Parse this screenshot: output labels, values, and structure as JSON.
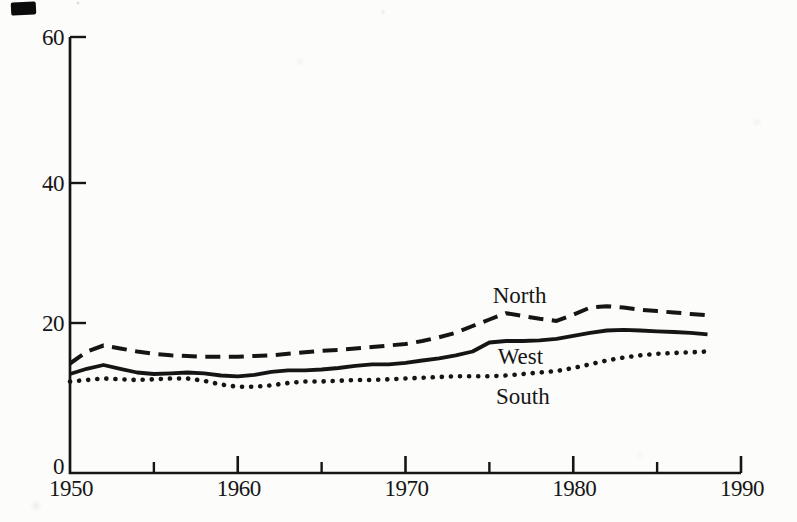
{
  "chart_data": {
    "type": "line",
    "title": "",
    "xlabel": "",
    "ylabel": "",
    "xlim": [
      1950,
      1990
    ],
    "ylim": [
      0,
      60
    ],
    "grid": false,
    "legend_position": "inline-annotations",
    "y_ticks": [
      0,
      20,
      40,
      60
    ],
    "x_tick_minor_years": [
      1955,
      1965,
      1975,
      1985
    ],
    "x_tick_major_years": [
      1960,
      1970,
      1980,
      1990
    ],
    "x_tick_labels": [
      "1950",
      "1960",
      "1970",
      "1980",
      "1990"
    ],
    "x_tick_label_years": [
      1950,
      1960,
      1970,
      1980,
      1990
    ],
    "line_color": "#151515",
    "x": [
      1950,
      1951,
      1952,
      1953,
      1954,
      1955,
      1956,
      1957,
      1958,
      1959,
      1960,
      1961,
      1962,
      1963,
      1964,
      1965,
      1966,
      1967,
      1968,
      1969,
      1970,
      1971,
      1972,
      1973,
      1974,
      1975,
      1976,
      1977,
      1978,
      1979,
      1980,
      1981,
      1982,
      1983,
      1984,
      1985,
      1986,
      1987,
      1988
    ],
    "series": [
      {
        "name": "North",
        "line_style": "dashed",
        "values": [
          14.6,
          16.2,
          17.0,
          16.6,
          16.2,
          15.9,
          15.7,
          15.6,
          15.5,
          15.5,
          15.5,
          15.6,
          15.7,
          15.9,
          16.1,
          16.3,
          16.4,
          16.6,
          16.8,
          17.0,
          17.2,
          17.6,
          18.1,
          18.7,
          19.6,
          20.5,
          21.4,
          21.0,
          20.6,
          20.3,
          21.2,
          22.2,
          22.4,
          22.2,
          21.9,
          21.7,
          21.5,
          21.3,
          21.1
        ]
      },
      {
        "name": "West",
        "line_style": "solid",
        "values": [
          13.2,
          13.9,
          14.4,
          13.9,
          13.4,
          13.2,
          13.3,
          13.4,
          13.3,
          13.0,
          12.9,
          13.1,
          13.5,
          13.7,
          13.7,
          13.8,
          14.0,
          14.3,
          14.5,
          14.5,
          14.7,
          15.0,
          15.3,
          15.7,
          16.2,
          17.4,
          17.6,
          17.6,
          17.7,
          17.9,
          18.3,
          18.7,
          19.0,
          19.1,
          19.0,
          18.9,
          18.8,
          18.7,
          18.5
        ]
      },
      {
        "name": "South",
        "line_style": "dotted",
        "values": [
          12.2,
          12.4,
          12.6,
          12.5,
          12.4,
          12.5,
          12.6,
          12.6,
          12.3,
          11.8,
          11.5,
          11.5,
          11.7,
          12.0,
          12.2,
          12.2,
          12.3,
          12.4,
          12.4,
          12.5,
          12.6,
          12.7,
          12.8,
          12.9,
          12.9,
          12.9,
          13.0,
          13.2,
          13.4,
          13.6,
          14.0,
          14.5,
          15.0,
          15.4,
          15.7,
          15.9,
          16.0,
          16.1,
          16.2
        ]
      }
    ],
    "annotations": [
      {
        "text": "North",
        "year": 1975.2,
        "value": 22.9
      },
      {
        "text": "West",
        "year": 1975.5,
        "value": 14.6
      },
      {
        "text": "South",
        "year": 1975.4,
        "value": 9.2
      }
    ]
  },
  "artifact": {
    "ink_blot": "scan ink mark, top-left"
  }
}
